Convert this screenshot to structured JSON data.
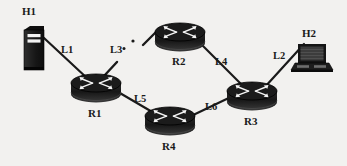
{
  "diagram": {
    "background_color": "#f2f1ef",
    "ink_color": "#1a1a1a",
    "nodes": [
      {
        "id": "H1",
        "label": "H1",
        "type": "server-tower-icon",
        "x": 34,
        "y": 48,
        "label_x": 22,
        "label_y": 6
      },
      {
        "id": "H2",
        "label": "H2",
        "type": "laptop-icon",
        "x": 312,
        "y": 57,
        "label_x": 302,
        "label_y": 28
      },
      {
        "id": "R1",
        "label": "R1",
        "type": "router-icon",
        "x": 96,
        "y": 85,
        "label_x": 88,
        "label_y": 108
      },
      {
        "id": "R2",
        "label": "R2",
        "type": "router-icon",
        "x": 180,
        "y": 34,
        "label_x": 172,
        "label_y": 56
      },
      {
        "id": "R3",
        "label": "R3",
        "type": "router-icon",
        "x": 252,
        "y": 93,
        "label_x": 244,
        "label_y": 116
      },
      {
        "id": "R4",
        "label": "R4",
        "type": "router-icon",
        "x": 170,
        "y": 118,
        "label_x": 162,
        "label_y": 141
      }
    ],
    "links": [
      {
        "id": "L1",
        "label": "L1",
        "from": "H1",
        "to": "R1",
        "style": "solid",
        "label_x": 61,
        "label_y": 44
      },
      {
        "id": "L2",
        "label": "L2",
        "from": "R3",
        "to": "H2",
        "style": "solid",
        "label_x": 273,
        "label_y": 50
      },
      {
        "id": "L3",
        "label": "L3",
        "from": "R1",
        "to": "R2",
        "style": "broken",
        "label_x": 110,
        "label_y": 44
      },
      {
        "id": "L4",
        "label": "L4",
        "from": "R2",
        "to": "R3",
        "style": "solid",
        "label_x": 215,
        "label_y": 56
      },
      {
        "id": "L5",
        "label": "L5",
        "from": "R1",
        "to": "R4",
        "style": "solid",
        "label_x": 134,
        "label_y": 93
      },
      {
        "id": "L6",
        "label": "L6",
        "from": "R4",
        "to": "R3",
        "style": "solid",
        "label_x": 205,
        "label_y": 101
      }
    ]
  }
}
